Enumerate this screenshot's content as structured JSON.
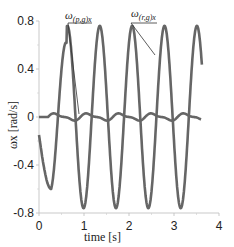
{
  "chart_data": {
    "type": "line",
    "title": "",
    "xlabel": "time [s]",
    "ylabel": "ωx [rad/s]",
    "xlim": [
      0,
      4
    ],
    "ylim": [
      -0.8,
      0.8
    ],
    "xticks": [
      "0",
      "1",
      "2",
      "3",
      "4"
    ],
    "yticks": [
      "0.8",
      "0.4",
      "0",
      "-0.4",
      "-0.8"
    ],
    "grid": false,
    "legend": "annotations",
    "series": [
      {
        "name": "ω(r,g)x",
        "color": "#666666",
        "description": "large-amplitude oscillation, amplitude ~0.76 rad/s, period ~0.72 s",
        "x": [
          0.0,
          0.1,
          0.27,
          0.5,
          0.75,
          0.88,
          1.1,
          1.25,
          1.45,
          1.6,
          1.8,
          1.97,
          2.17,
          2.32,
          2.52,
          2.7,
          2.88,
          3.03,
          3.22,
          3.4,
          3.6
        ],
        "y": [
          -0.15,
          -0.35,
          -0.6,
          0.76,
          -0.2,
          -0.76,
          0.3,
          0.76,
          -0.3,
          -0.76,
          0.3,
          0.76,
          -0.3,
          -0.76,
          0.3,
          0.76,
          -0.3,
          -0.76,
          0.3,
          0.76,
          -0.5
        ]
      },
      {
        "name": "ω(p,g)x",
        "color": "#666666",
        "description": "small oscillation near zero, amplitude ~0.03 rad/s",
        "x": [
          0.0,
          0.2,
          0.35,
          0.5,
          0.7,
          0.9,
          1.05,
          1.25,
          1.45,
          1.6,
          1.8,
          2.0,
          2.15,
          2.35,
          2.55,
          2.7,
          2.9,
          3.1,
          3.25,
          3.45,
          3.6
        ],
        "y": [
          0.0,
          0.0,
          0.03,
          0.02,
          -0.03,
          0.0,
          0.03,
          0.01,
          -0.03,
          0.0,
          0.03,
          0.01,
          -0.03,
          0.0,
          0.03,
          0.01,
          -0.03,
          0.0,
          0.03,
          -0.02,
          -0.02
        ]
      }
    ],
    "annotations": [
      {
        "text_main": "ω",
        "text_sub": "(p,g)x",
        "target": "small series"
      },
      {
        "text_main": "ω",
        "text_sub": "(r,g)x",
        "target": "large series"
      }
    ]
  }
}
